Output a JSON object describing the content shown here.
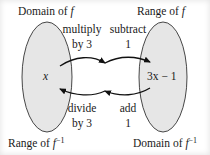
{
  "diagram": {
    "type": "function-inverse-mapping",
    "colors": {
      "ellipse_fill": "#e6e6e6",
      "ellipse_stroke": "#333333",
      "arrow": "#111111",
      "text": "#1a1a1a",
      "background": "#ffffff"
    },
    "left_set": {
      "top_label_prefix": "Domain of ",
      "top_label_var": "f",
      "bottom_label_prefix": "Range of ",
      "bottom_label_var": "f",
      "bottom_label_sup": "−1",
      "element": "x"
    },
    "right_set": {
      "top_label_prefix": "Range of ",
      "top_label_var": "f",
      "bottom_label_prefix": "Domain of ",
      "bottom_label_var": "f",
      "bottom_label_sup": "−1",
      "element": "3x − 1"
    },
    "forward_steps": [
      {
        "line1": "multiply",
        "line2": "by 3"
      },
      {
        "line1": "subtract",
        "line2": "1"
      }
    ],
    "inverse_steps": [
      {
        "line1": "divide",
        "line2": "by 3"
      },
      {
        "line1": "add",
        "line2": "1"
      }
    ]
  }
}
